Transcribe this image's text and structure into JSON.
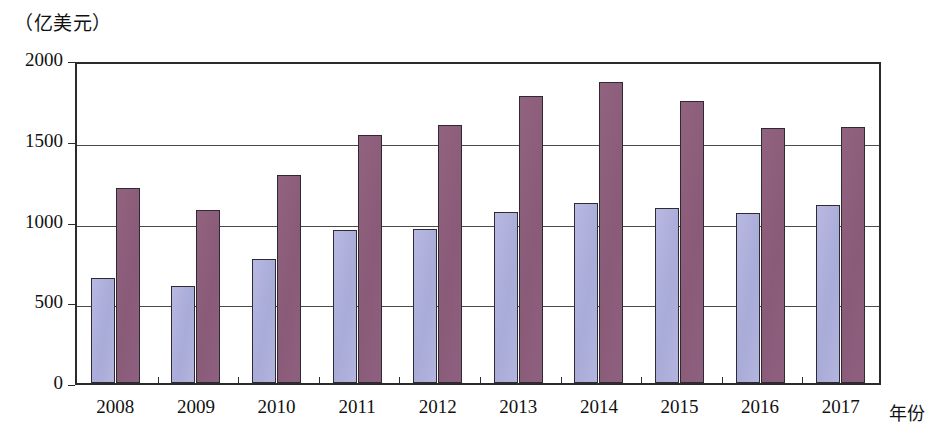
{
  "chart_data": {
    "type": "bar",
    "title": "",
    "subtitle": "",
    "unit_label": "（亿美元）",
    "xlabel": "年份",
    "ylabel": "",
    "categories": [
      "2008",
      "2009",
      "2010",
      "2011",
      "2012",
      "2013",
      "2014",
      "2015",
      "2016",
      "2017"
    ],
    "series": [
      {
        "name": "series-1",
        "color": "#aeb0dc",
        "values": [
          650,
          600,
          770,
          945,
          955,
          1060,
          1115,
          1085,
          1050,
          1100
        ]
      },
      {
        "name": "series-2",
        "color": "#8a5b78",
        "values": [
          1205,
          1070,
          1290,
          1535,
          1595,
          1775,
          1865,
          1745,
          1580,
          1585
        ]
      }
    ],
    "ylim": [
      0,
      2000
    ],
    "yticks": [
      0,
      500,
      1000,
      1500,
      2000
    ],
    "ytick_labels": [
      "0",
      "500",
      "1000",
      "1500",
      "2000"
    ],
    "grid": true,
    "legend": "none",
    "bar_border_color": "#2d2a33",
    "axis_color": "#2b2b2b"
  }
}
